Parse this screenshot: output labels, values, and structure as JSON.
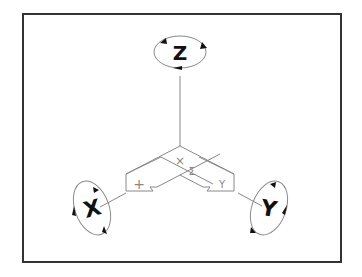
{
  "diagram": {
    "axes": [
      {
        "id": "z",
        "label": "Z",
        "rotation_hint": "rotate about Z"
      },
      {
        "id": "x",
        "label": "X",
        "rotation_hint": "rotate about X"
      },
      {
        "id": "y",
        "label": "Y",
        "rotation_hint": "rotate about Y"
      }
    ],
    "plane_labels": {
      "center_top": "×",
      "center_mid": "Σ",
      "left_arrow": "+",
      "right_arrow": "Y"
    },
    "colors": {
      "frame": "#333333",
      "line": "#888888",
      "ink": "#111111",
      "background": "#ffffff"
    }
  }
}
